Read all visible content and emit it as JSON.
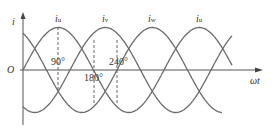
{
  "diagram": {
    "y_axis_label": "i",
    "x_axis_label": "ωt",
    "origin_label": "O",
    "curves": [
      {
        "name": "i_u",
        "label_main": "i",
        "label_sub": "u",
        "peak_deg": 90
      },
      {
        "name": "i_v",
        "label_main": "i",
        "label_sub": "v",
        "peak_deg": 210
      },
      {
        "name": "i_w",
        "label_main": "i",
        "label_sub": "w",
        "peak_deg": 330
      },
      {
        "name": "i_u",
        "label_main": "i",
        "label_sub": "u",
        "peak_deg": 450
      }
    ],
    "angle_markers": [
      {
        "label": "90°",
        "deg": 90
      },
      {
        "label": "180°",
        "deg": 180
      },
      {
        "label": "240°",
        "deg": 240
      }
    ],
    "colors": {
      "curve": "#666666",
      "axis": "#555555",
      "text": "#333333"
    }
  }
}
